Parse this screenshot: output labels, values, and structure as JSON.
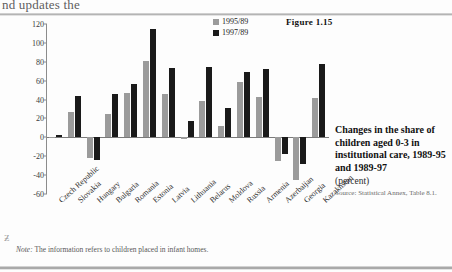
{
  "page": {
    "bleed_text": "nd updates the",
    "stray_glyph": "Ƶ"
  },
  "figure_number": "Figure 1.15",
  "legend": {
    "items": [
      {
        "label": "1995/89",
        "color": "#9b9b9b"
      },
      {
        "label": "1997/89",
        "color": "#1a1a1a"
      }
    ]
  },
  "caption": {
    "title": "Changes in the share of children aged 0-3 in institutional care, 1989-95 and 1989-97",
    "unit": "(percent)",
    "source": "Source: Statistical Annex, Table 8.1."
  },
  "note": {
    "prefix": "Note:",
    "text": " The information refers to children placed in infant homes."
  },
  "chart_data": {
    "type": "bar",
    "title": "Changes in the share of children aged 0-3 in institutional care, 1989-95 and 1989-97",
    "xlabel": "",
    "ylabel": "",
    "ylim": [
      -60,
      120
    ],
    "yticks": [
      120,
      100,
      80,
      60,
      40,
      20,
      0,
      -20,
      -40,
      -60
    ],
    "ytick_labels": [
      "120",
      "100",
      "80",
      "60",
      "40",
      "20",
      "0",
      "-20",
      "-40",
      "-60"
    ],
    "grid": false,
    "legend_position": "top-right",
    "categories": [
      "Czech Republic",
      "Slovakia",
      "Hungary",
      "Bulgaria",
      "Romania",
      "Estonia",
      "Latvia",
      "Lithuania",
      "Belarus",
      "Moldova",
      "Russia",
      "Armenia",
      "Azerbaijan",
      "Georgia",
      "Kazakhstan"
    ],
    "series": [
      {
        "name": "1995/89",
        "color": "#9b9b9b",
        "values": [
          -1,
          27,
          -22,
          25,
          47,
          81,
          46,
          -2,
          39,
          12,
          59,
          43,
          -25,
          -45,
          42
        ]
      },
      {
        "name": "1997/89",
        "color": "#1a1a1a",
        "values": [
          3,
          44,
          -24,
          46,
          56,
          115,
          73,
          17,
          75,
          31,
          69,
          72,
          -18,
          -28,
          78
        ]
      }
    ]
  }
}
